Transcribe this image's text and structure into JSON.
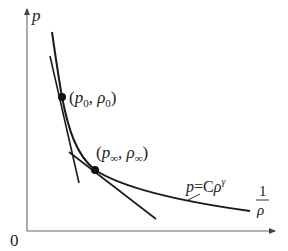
{
  "diagram": {
    "axes": {
      "y_label": "p",
      "x_label_num": "1",
      "x_label_den": "ρ",
      "origin_label": "0"
    },
    "points": [
      {
        "id": "p0",
        "label_open": "(",
        "p": "p",
        "p_sub": "0",
        "sep": ", ",
        "rho": "ρ",
        "rho_sub": "0",
        "label_close": ")"
      },
      {
        "id": "pinf",
        "label_open": "(",
        "p": "p",
        "p_sub": "∞",
        "sep": ", ",
        "rho": "ρ",
        "rho_sub": "∞",
        "label_close": ")"
      }
    ],
    "curve_label": {
      "lhs": "p",
      "eq": "=C",
      "rho": "ρ",
      "exp": "γ"
    },
    "colors": {
      "line": "#1a1a1a",
      "axis": "#555555",
      "text": "#222222"
    }
  }
}
